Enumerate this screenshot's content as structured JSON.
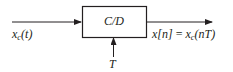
{
  "diagram": {
    "type": "block-diagram",
    "block": {
      "label": "C/D"
    },
    "input": {
      "symbol": "x",
      "subscript": "c",
      "arg": "(t)"
    },
    "output": {
      "lhs": "x[n]",
      "equals": " = ",
      "rhs_symbol": "x",
      "rhs_subscript": "c",
      "rhs_arg": "(nT)"
    },
    "control": {
      "label": "T"
    },
    "colors": {
      "line": "#231f20",
      "background": "#ffffff"
    }
  }
}
